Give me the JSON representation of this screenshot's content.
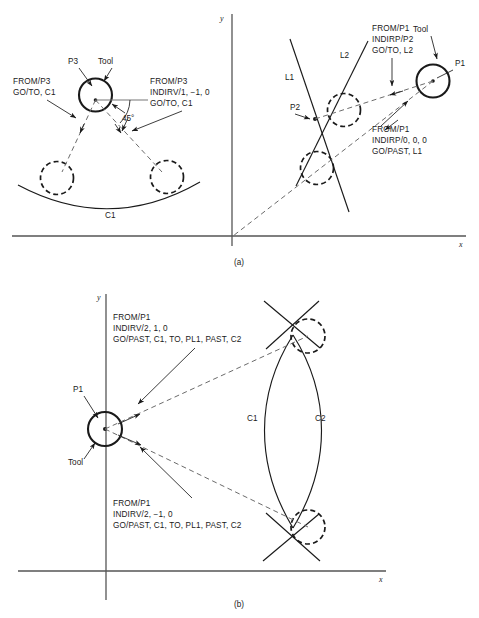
{
  "figure": {
    "caption_a": "(a)",
    "caption_b": "(b)"
  },
  "panel_a": {
    "axis_x_label": "x",
    "axis_y_label": "y",
    "left_scene": {
      "point_label": "P3",
      "tool_label": "Tool",
      "curve_label": "C1",
      "angle_label": "45°",
      "block_left": {
        "line1": "FROM/P3",
        "line2": "GO/TO, C1"
      },
      "block_right": {
        "line1": "FROM/P3",
        "line2": "INDIRV/1, −1, 0",
        "line3": "GO/TO, C1"
      }
    },
    "right_scene": {
      "point_label_p1": "P1",
      "point_label_p2": "P2",
      "tool_label": "Tool",
      "line_label_l1": "L1",
      "line_label_l2": "L2",
      "block_top": {
        "line1": "FROM/P1",
        "line2": "INDIRP/P2",
        "line3": "GO/TO, L2"
      },
      "block_bottom": {
        "line1": "FROM/P1",
        "line2": "INDIRP/0, 0, 0",
        "line3": "GO/PAST, L1"
      }
    }
  },
  "panel_b": {
    "axis_x_label": "x",
    "axis_y_label": "y",
    "point_label_p1": "P1",
    "tool_label": "Tool",
    "curve_label_c1": "C1",
    "curve_label_c2": "C2",
    "block_top": {
      "line1": "FROM/P1",
      "line2": "INDIRV/2, 1, 0",
      "line3": "GO/PAST, C1, TO, PL1, PAST, C2"
    },
    "block_bottom": {
      "line1": "FROM/P1",
      "line2": "INDIRV/2, −1, 0",
      "line3": "GO/PAST, C1, TO, PL1, PAST, C2"
    }
  }
}
